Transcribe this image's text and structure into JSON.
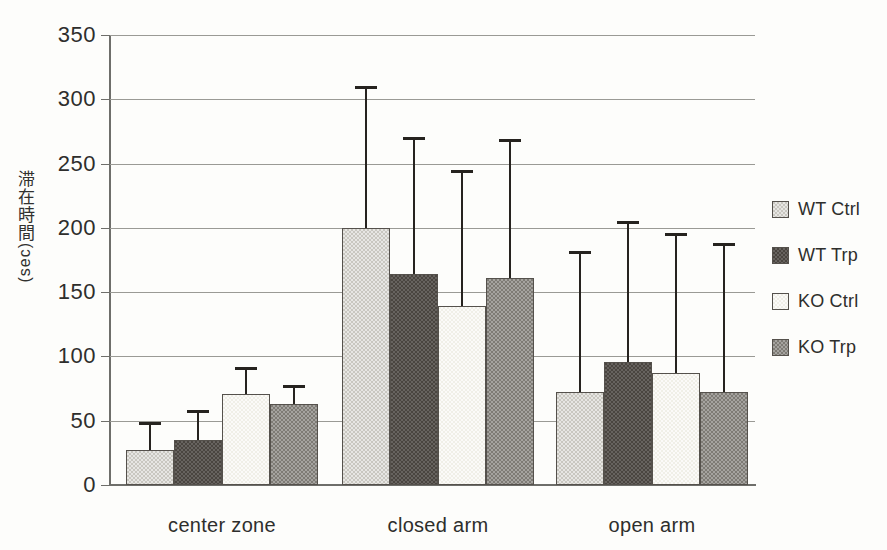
{
  "chart_data": {
    "type": "bar",
    "title": "",
    "xlabel": "",
    "ylabel": "滞在時間 (sec)",
    "ylabel_jp": "滞在時間",
    "ylabel_unit": "(sec)",
    "categories": [
      "center zone",
      "closed arm",
      "open arm"
    ],
    "ylim": [
      0,
      350
    ],
    "ytick_labels": [
      "0",
      "50",
      "100",
      "150",
      "200",
      "250",
      "300",
      "350"
    ],
    "ytick_values": [
      0,
      50,
      100,
      150,
      200,
      250,
      300,
      350
    ],
    "grid": true,
    "legend_position": "right",
    "error_bars": "upper only (SD)",
    "series": [
      {
        "name": "WT Ctrl",
        "color": "#c9c7c0",
        "values": [
          27,
          200,
          72
        ],
        "error_top": [
          49,
          310,
          182
        ]
      },
      {
        "name": "WT Trp",
        "color": "#4a4540",
        "values": [
          35,
          164,
          96
        ],
        "error_top": [
          58,
          271,
          205
        ]
      },
      {
        "name": "KO Ctrl",
        "color": "#f0efe7",
        "values": [
          71,
          139,
          87
        ],
        "error_top": [
          92,
          245,
          196
        ]
      },
      {
        "name": "KO Trp",
        "color": "#7e7b75",
        "values": [
          63,
          161,
          72
        ],
        "error_top": [
          78,
          269,
          188
        ]
      }
    ]
  },
  "legend": {
    "items": [
      {
        "label": "WT Ctrl",
        "swatch_class": "fill-wt-ctrl"
      },
      {
        "label": "WT Trp",
        "swatch_class": "fill-wt-trp"
      },
      {
        "label": "KO Ctrl",
        "swatch_class": "fill-ko-ctrl"
      },
      {
        "label": "KO Trp",
        "swatch_class": "fill-ko-trp"
      }
    ]
  },
  "caption_strip": {
    "text": ""
  }
}
